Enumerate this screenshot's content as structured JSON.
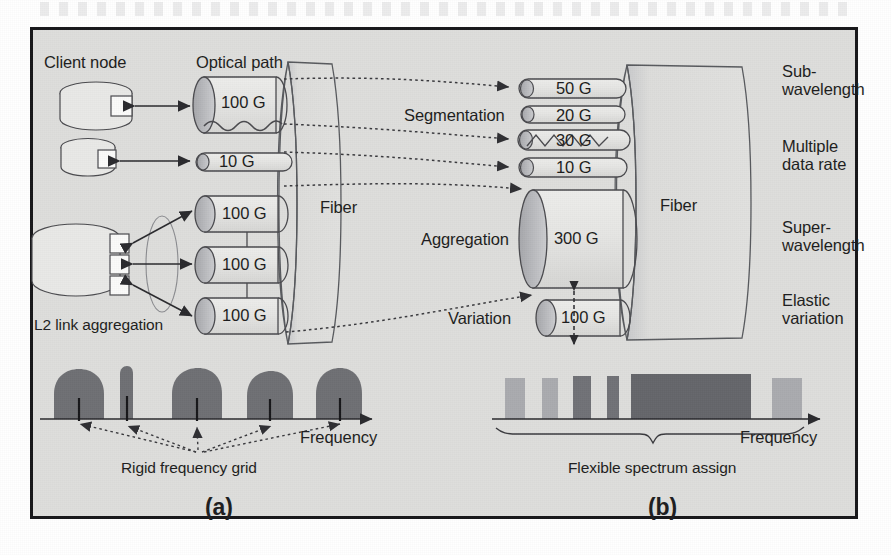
{
  "figure": {
    "panel_a_letter": "(a)",
    "panel_b_letter": "(b)"
  },
  "panel_a": {
    "labels": {
      "client_node": "Client node",
      "optical_path": "Optical path",
      "fiber": "Fiber",
      "l2_link_aggregation": "L2 link aggregation",
      "frequency_axis": "Frequency",
      "rigid_grid": "Rigid frequency grid"
    },
    "paths": [
      {
        "rate": "100 G",
        "style": "wide-wavy"
      },
      {
        "rate": "10 G",
        "style": "thin"
      },
      {
        "rate": "100 G",
        "style": "wide"
      },
      {
        "rate": "100 G",
        "style": "wide"
      },
      {
        "rate": "100 G",
        "style": "wide"
      }
    ],
    "spectrum": {
      "type": "rigid-grid",
      "shape": "hump",
      "channels": [
        {
          "center": 62,
          "width": 46,
          "height": 46,
          "shade": "#6f7074"
        },
        {
          "center": 125,
          "width": 12,
          "height": 52,
          "shade": "#6f7074"
        },
        {
          "center": 196,
          "width": 48,
          "height": 46,
          "shade": "#6f7074"
        },
        {
          "center": 268,
          "width": 44,
          "height": 44,
          "shade": "#6f7074"
        },
        {
          "center": 336,
          "width": 42,
          "height": 46,
          "shade": "#6f7074"
        }
      ]
    }
  },
  "panel_b": {
    "labels": {
      "segmentation": "Segmentation",
      "aggregation": "Aggregation",
      "variation": "Variation",
      "fiber": "Fiber",
      "frequency_axis": "Frequency",
      "flexible_spectrum": "Flexible spectrum assign"
    },
    "side_labels": [
      {
        "line1": "Sub-",
        "line2": "wavelength"
      },
      {
        "line1": "Multiple",
        "line2": "data rate"
      },
      {
        "line1": "Super-",
        "line2": "wavelength"
      },
      {
        "line1": "Elastic",
        "line2": "variation"
      }
    ],
    "paths": [
      {
        "rate": "50 G",
        "style": "thin"
      },
      {
        "rate": "20 G",
        "style": "thin"
      },
      {
        "rate": "30 G",
        "style": "thin-wavy"
      },
      {
        "rate": "10 G",
        "style": "thin"
      },
      {
        "rate": "300 G",
        "style": "super"
      },
      {
        "rate": "100 G",
        "style": "elastic"
      }
    ],
    "spectrum": {
      "type": "flexible-assign",
      "shape": "rect",
      "channels": [
        {
          "x": 505,
          "width": 20,
          "height": 40,
          "shade": "#aaabaf"
        },
        {
          "x": 542,
          "width": 16,
          "height": 40,
          "shade": "#aaabaf"
        },
        {
          "x": 573,
          "width": 18,
          "height": 42,
          "shade": "#717277"
        },
        {
          "x": 607,
          "width": 12,
          "height": 42,
          "shade": "#717277"
        },
        {
          "x": 631,
          "width": 120,
          "height": 44,
          "shade": "#65666b"
        },
        {
          "x": 772,
          "width": 30,
          "height": 40,
          "shade": "#aaabaf"
        }
      ]
    }
  },
  "colors": {
    "background": "#dededc",
    "frame_border": "#17171a",
    "text": "#1d1d20",
    "cylinder_fill": "#e4e4e2",
    "cylinder_cap": "#b9babd",
    "fiber_fill": "#dcdcda",
    "fiber_cap": "#b4b5b8",
    "stroke": "#4a4a4e",
    "spectrum_dark": "#6f7074",
    "spectrum_light": "#aaabaf"
  }
}
